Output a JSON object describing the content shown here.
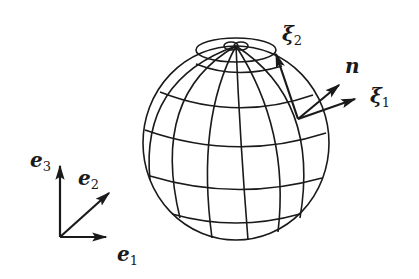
{
  "diagram": {
    "type": "sphere-with-local-frame",
    "colors": {
      "line": "#1a1a1a",
      "background": "#ffffff"
    },
    "sphere": {
      "cx": 236,
      "cy": 143,
      "r": 93,
      "latitudes": 5,
      "longitudes": 8
    },
    "local_frame": {
      "origin": [
        298,
        119
      ],
      "vectors": [
        {
          "id": "xi1",
          "symbol": "ξ",
          "sub": "1",
          "tip": [
            355,
            99
          ]
        },
        {
          "id": "n",
          "symbol": "n",
          "sub": "",
          "tip": [
            339,
            85
          ]
        },
        {
          "id": "xi2",
          "symbol": "ξ",
          "sub": "2",
          "tip": [
            276,
            54
          ]
        }
      ]
    },
    "global_frame": {
      "origin": [
        60,
        237
      ],
      "vectors": [
        {
          "id": "e1",
          "symbol": "e",
          "sub": "1",
          "tip": [
            106,
            237
          ]
        },
        {
          "id": "e2",
          "symbol": "e",
          "sub": "2",
          "tip": [
            109,
            193
          ]
        },
        {
          "id": "e3",
          "symbol": "e",
          "sub": "3",
          "tip": [
            60,
            166
          ]
        }
      ]
    },
    "labels": {
      "xi1": {
        "symbol": "ξ",
        "sub": "1"
      },
      "xi2": {
        "symbol": "ξ",
        "sub": "2"
      },
      "n": {
        "symbol": "n"
      },
      "e1": {
        "symbol": "e",
        "sub": "1"
      },
      "e2": {
        "symbol": "e",
        "sub": "2"
      },
      "e3": {
        "symbol": "e",
        "sub": "3"
      }
    }
  }
}
